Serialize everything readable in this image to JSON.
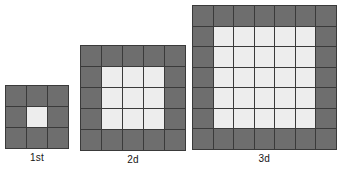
{
  "background_color": "#ffffff",
  "colors": {
    "dark_cell": "#6e6e6e",
    "light_cell": "#ededed",
    "grid_line": "#3a3a3a",
    "caption_text": "#151515"
  },
  "chart_data": {
    "type": "diagram",
    "title": "",
    "figures": [
      {
        "label": "1st",
        "size": 3,
        "total_cells": 9,
        "dark_cells": 8,
        "light_cells": 1,
        "interior_size": 1,
        "pixel_size": 63,
        "cell_px": 20
      },
      {
        "label": "2d",
        "size": 5,
        "total_cells": 25,
        "dark_cells": 16,
        "light_cells": 9,
        "interior_size": 3,
        "pixel_size": 104,
        "cell_px": 20
      },
      {
        "label": "3d",
        "size": 7,
        "total_cells": 49,
        "dark_cells": 24,
        "light_cells": 25,
        "interior_size": 5,
        "pixel_size": 141,
        "cell_px": 19.5
      }
    ]
  }
}
